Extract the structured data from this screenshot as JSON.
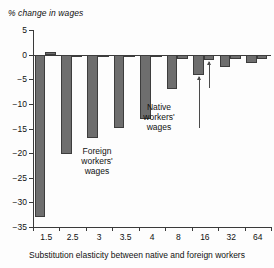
{
  "chart_data": {
    "type": "bar",
    "title": "% change in wages",
    "xlabel": "Substitution elasticity between native and foreign workers",
    "ylabel": "% change in wages",
    "categories": [
      "1.5",
      "2.5",
      "3",
      "3.5",
      "4",
      "8",
      "16",
      "32",
      "64"
    ],
    "series": [
      {
        "name": "Foreign workers' wages",
        "values": [
          -33.0,
          -20.2,
          -17.0,
          -14.8,
          -13.0,
          -7.0,
          -4.2,
          -2.6,
          -1.6
        ]
      },
      {
        "name": "Native workers' wages",
        "values": [
          0.6,
          -0.1,
          -0.2,
          -0.3,
          -0.4,
          -0.8,
          -1.1,
          -0.9,
          -0.8
        ]
      }
    ],
    "ylim": [
      -35,
      5
    ],
    "yticks": [
      5,
      0,
      -5,
      -10,
      -15,
      -20,
      -25,
      -30,
      -35
    ],
    "yticklabels": [
      "5",
      "0",
      "−5",
      "−10",
      "−15",
      "−20",
      "−25",
      "−30",
      "−35"
    ],
    "grid": false,
    "legend": "none",
    "annotations": [
      {
        "id": "foreign-workers-annotation",
        "lines": [
          "Foreign",
          "workers'",
          "wages"
        ],
        "points_to": "foreign bar at elasticity 16"
      },
      {
        "id": "native-workers-annotation",
        "lines": [
          "Native",
          "workers'",
          "wages"
        ],
        "points_to": "native bar at elasticity 16"
      }
    ],
    "colors": {
      "bar_fill": "#6e6e6e",
      "bar_stroke": "#3d3d3d",
      "axis": "#3a3a3a",
      "text": "#111111",
      "background": "#fdfdfd"
    }
  }
}
